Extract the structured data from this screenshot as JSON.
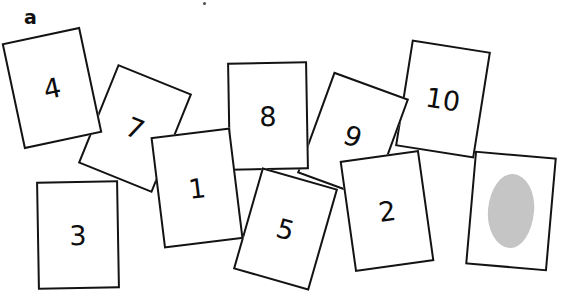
{
  "figure": {
    "panel_label": "a",
    "background_color": "#ffffff",
    "ink_color": "#131313",
    "blob_color": "#c0c0c0",
    "width": 577,
    "height": 304
  },
  "cards": [
    {
      "id": "card-4",
      "label": "4",
      "left": 12,
      "top": 34,
      "width": 80,
      "height": 108,
      "rotation": -12,
      "z": 6,
      "has_blob": false
    },
    {
      "id": "card-3",
      "label": "3",
      "left": 37,
      "top": 181,
      "width": 82,
      "height": 108,
      "rotation": -1,
      "z": 7,
      "has_blob": false
    },
    {
      "id": "card-7",
      "label": "7",
      "left": 95,
      "top": 75,
      "width": 80,
      "height": 107,
      "rotation": 22,
      "z": 5,
      "has_blob": false
    },
    {
      "id": "card-1",
      "label": "1",
      "left": 157,
      "top": 132,
      "width": 80,
      "height": 112,
      "rotation": -7,
      "z": 9,
      "has_blob": false
    },
    {
      "id": "card-8",
      "label": "8",
      "left": 228,
      "top": 62,
      "width": 80,
      "height": 108,
      "rotation": -1,
      "z": 6,
      "has_blob": false
    },
    {
      "id": "card-5",
      "label": "5",
      "left": 246,
      "top": 176,
      "width": 79,
      "height": 106,
      "rotation": 16,
      "z": 8,
      "has_blob": false
    },
    {
      "id": "card-9",
      "label": "9",
      "left": 313,
      "top": 82,
      "width": 80,
      "height": 108,
      "rotation": 20,
      "z": 4,
      "has_blob": false
    },
    {
      "id": "card-10",
      "label": "10",
      "left": 403,
      "top": 45,
      "width": 80,
      "height": 108,
      "rotation": 9,
      "z": 3,
      "has_blob": false
    },
    {
      "id": "card-2",
      "label": "2",
      "left": 347,
      "top": 155,
      "width": 80,
      "height": 112,
      "rotation": -8,
      "z": 8,
      "has_blob": false
    },
    {
      "id": "card-blob",
      "label": "",
      "left": 470,
      "top": 154,
      "width": 82,
      "height": 114,
      "rotation": 5,
      "z": 7,
      "has_blob": true
    }
  ],
  "artifacts": [
    {
      "id": "speck-top",
      "left": 203,
      "top": 2
    }
  ]
}
